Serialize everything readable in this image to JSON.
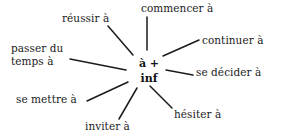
{
  "diagram": {
    "type": "radial-mind-map",
    "title": "à + inf",
    "background_color": "#ffffff",
    "line_color": "#1b1b1b",
    "text_color": "#1b1b1b",
    "hub": {
      "line1": "à +",
      "line2": "inf"
    },
    "nodes": [
      {
        "id": "commencer",
        "label": "commencer à",
        "position": "top"
      },
      {
        "id": "reussir",
        "label": "réussir à",
        "position": "top-left"
      },
      {
        "id": "continuer",
        "label": "continuer à",
        "position": "top-right"
      },
      {
        "id": "passer",
        "label": "passer du\ntemps à",
        "position": "left"
      },
      {
        "id": "decider",
        "label": "se décider à",
        "position": "right"
      },
      {
        "id": "mettre",
        "label": "se mettre à",
        "position": "bottom-left"
      },
      {
        "id": "inviter",
        "label": "inviter à",
        "position": "bottom"
      },
      {
        "id": "hesiter",
        "label": "hésiter à",
        "position": "bottom-right"
      }
    ],
    "spokes": [
      {
        "id": "spoke-commencer",
        "x1": 147,
        "y1": 17,
        "x2": 147,
        "y2": 50
      },
      {
        "id": "spoke-reussir",
        "x1": 108,
        "y1": 26,
        "x2": 133,
        "y2": 55
      },
      {
        "id": "spoke-continuer",
        "x1": 199,
        "y1": 40,
        "x2": 163,
        "y2": 56
      },
      {
        "id": "spoke-passer",
        "x1": 70,
        "y1": 59,
        "x2": 126,
        "y2": 70
      },
      {
        "id": "spoke-decider",
        "x1": 193,
        "y1": 75,
        "x2": 166,
        "y2": 70
      },
      {
        "id": "spoke-mettre",
        "x1": 87,
        "y1": 101,
        "x2": 128,
        "y2": 82
      },
      {
        "id": "spoke-inviter",
        "x1": 119,
        "y1": 119,
        "x2": 137,
        "y2": 88
      },
      {
        "id": "spoke-hesiter",
        "x1": 172,
        "y1": 108,
        "x2": 150,
        "y2": 86
      }
    ]
  }
}
